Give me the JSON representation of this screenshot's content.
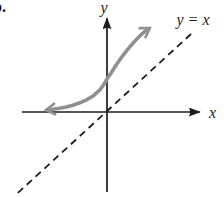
{
  "figure": {
    "item_label": "b.",
    "colors": {
      "background": "#ffffff",
      "axis": "#1c1c1c",
      "curve": "#909090"
    }
  },
  "chart_data": {
    "type": "line",
    "title": "",
    "xlabel": "x",
    "ylabel": "y",
    "grid": false,
    "legend": false,
    "axes": {
      "x_range": [
        -2.5,
        2.73
      ],
      "y_range": [
        -2.35,
        2.76
      ]
    },
    "pixel_mapping": {
      "origin_px": [
        107,
        112
      ],
      "unit_px": 34
    },
    "annotations": [
      {
        "text": "y = x",
        "refers_to": "identity-line"
      }
    ],
    "series": [
      {
        "name": "identity-line",
        "label": "y = x",
        "style": "dashed",
        "color": "#1c1c1c",
        "width": 1.8,
        "dash": [
          7,
          5
        ],
        "arrow_both_ends": false,
        "points": [
          [
            -2.62,
            -2.38
          ],
          [
            2.5,
            2.32
          ]
        ]
      },
      {
        "name": "function-curve",
        "label": "",
        "style": "solid",
        "color": "#909090",
        "width": 3.6,
        "arrow_both_ends": true,
        "points": [
          [
            -1.79,
            0.06
          ],
          [
            -1.6,
            0.08
          ],
          [
            -1.4,
            0.11
          ],
          [
            -1.2,
            0.15
          ],
          [
            -1.0,
            0.2
          ],
          [
            -0.8,
            0.27
          ],
          [
            -0.6,
            0.36
          ],
          [
            -0.4,
            0.48
          ],
          [
            -0.2,
            0.66
          ],
          [
            -0.1,
            0.8
          ],
          [
            0,
            0.97
          ],
          [
            0.12,
            1.15
          ],
          [
            0.25,
            1.35
          ],
          [
            0.4,
            1.57
          ],
          [
            0.55,
            1.77
          ],
          [
            0.7,
            1.95
          ],
          [
            0.85,
            2.12
          ],
          [
            1.0,
            2.27
          ],
          [
            1.15,
            2.4
          ],
          [
            1.26,
            2.47
          ]
        ]
      }
    ]
  }
}
